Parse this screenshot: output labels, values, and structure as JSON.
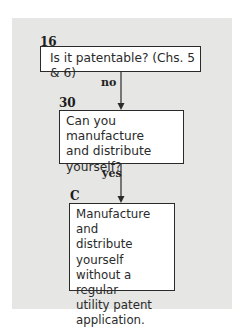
{
  "flowchart": {
    "nodes": [
      {
        "id": "16",
        "text": "Is it patentable? (Chs. 5 & 6)"
      },
      {
        "id": "30",
        "text_lines": [
          "Can you manufacture",
          "and distribute",
          "yourself?"
        ]
      },
      {
        "id": "C",
        "text_lines": [
          "Manufacture and",
          "distribute yourself",
          "without a regular",
          "utility patent",
          "application."
        ]
      }
    ],
    "edges": [
      {
        "from": "16",
        "to": "30",
        "label": "no"
      },
      {
        "from": "30",
        "to": "C",
        "label": "yes"
      }
    ]
  },
  "colors": {
    "panel_background": "#e6e6e4",
    "box_background": "#ffffff",
    "border": "#2a2a2a"
  }
}
